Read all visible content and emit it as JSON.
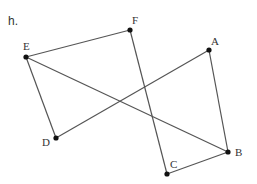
{
  "part_label": "h.",
  "points": [
    {
      "name": "A",
      "x": 209,
      "y": 50,
      "lx": 211,
      "ly": 36
    },
    {
      "name": "B",
      "x": 228,
      "y": 152,
      "lx": 235,
      "ly": 147
    },
    {
      "name": "C",
      "x": 167,
      "y": 174,
      "lx": 170,
      "ly": 159
    },
    {
      "name": "D",
      "x": 56,
      "y": 138,
      "lx": 42,
      "ly": 137
    },
    {
      "name": "E",
      "x": 26,
      "y": 57,
      "lx": 23,
      "ly": 41
    },
    {
      "name": "F",
      "x": 130,
      "y": 30,
      "lx": 132,
      "ly": 15
    }
  ],
  "segments": [
    [
      "E",
      "F"
    ],
    [
      "F",
      "C"
    ],
    [
      "C",
      "B"
    ],
    [
      "B",
      "A"
    ],
    [
      "A",
      "D"
    ],
    [
      "D",
      "E"
    ],
    [
      "E",
      "B"
    ]
  ],
  "colors": {
    "line": "#555555",
    "point": "#111111"
  }
}
